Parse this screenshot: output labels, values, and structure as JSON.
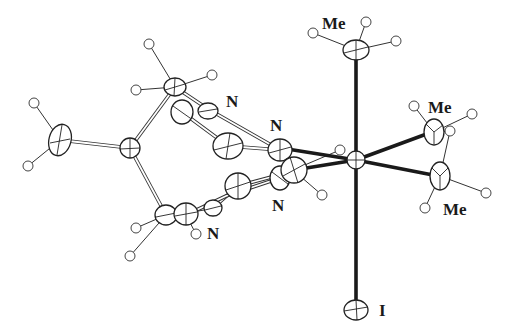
{
  "diagram": {
    "type": "ORTEP molecular structure",
    "labels": {
      "me_top": "Me",
      "me_right_upper": "Me",
      "me_right_lower": "Me",
      "n_upper_left": "N",
      "n_upper_right": "N",
      "n_lower_right": "N",
      "n_lower_left": "N",
      "iodine": "I"
    },
    "colors": {
      "background": "#ffffff",
      "ink": "#1a1a1a"
    }
  }
}
